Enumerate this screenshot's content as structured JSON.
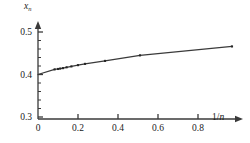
{
  "chart_data": {
    "type": "line",
    "title": "",
    "subtitle": "",
    "xlabel": "1/n",
    "ylabel": "x_n",
    "ylabel_base": "x",
    "ylabel_sub": "n",
    "xlim": [
      0,
      1.0
    ],
    "ylim": [
      0.3,
      0.52
    ],
    "grid": false,
    "legend": "none",
    "x_ticks": [
      0,
      0.2,
      0.4,
      0.6,
      0.8
    ],
    "x_tick_labels": [
      "0",
      "0.2",
      "0.4",
      "0.6",
      "0.8"
    ],
    "y_ticks": [
      0.3,
      0.4,
      0.5
    ],
    "y_tick_labels": [
      "0.3",
      "0.4",
      "0.5"
    ],
    "y_minor_step": 0.02,
    "marker": "square",
    "marker_color": "#262626",
    "line_color": "#3a3a3a",
    "axis_color": "#3a3a3a",
    "series": [
      {
        "name": "x_n",
        "x": [
          0.083,
          0.1,
          0.111,
          0.125,
          0.143,
          0.167,
          0.2,
          0.235,
          0.335,
          0.51,
          0.97
        ],
        "values": [
          0.412,
          0.413,
          0.414,
          0.415,
          0.417,
          0.419,
          0.422,
          0.425,
          0.432,
          0.445,
          0.466
        ]
      }
    ],
    "extrapolated_intercept": {
      "x": 0.0,
      "y": 0.4
    },
    "annotations": []
  }
}
